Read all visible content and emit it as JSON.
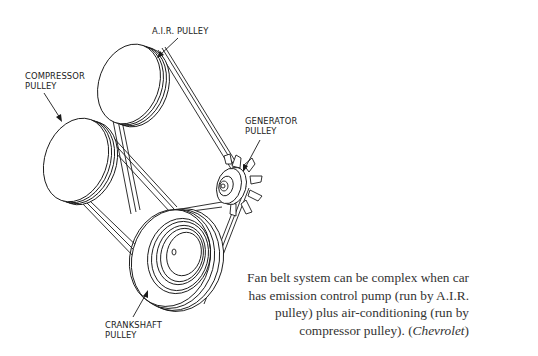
{
  "labels": {
    "air_pulley": "A.I.R. PULLEY",
    "compressor_pulley_line1": "COMPRESSOR",
    "compressor_pulley_line2": "PULLEY",
    "generator_pulley_line1": "GENERATOR",
    "generator_pulley_line2": "PULLEY",
    "crankshaft_pulley_line1": "CRANKSHAFT",
    "crankshaft_pulley_line2": "PULLEY"
  },
  "caption": {
    "line1": "Fan belt system can be complex when car",
    "line2": "has emission control pump (run by A.I.R.",
    "line3": "pulley) plus air-conditioning (run by",
    "line4_text": "compressor pulley). (",
    "line4_source": "Chevrolet",
    "line4_end": ")"
  },
  "colors": {
    "ink": "#1a1a1a",
    "caption": "#333333",
    "background": "#ffffff"
  }
}
